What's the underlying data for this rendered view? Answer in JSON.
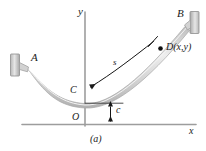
{
  "figure": {
    "caption": "(a)",
    "axes": {
      "x_label": "x",
      "y_label": "y",
      "origin_label": "O"
    },
    "points": [
      {
        "id": "A",
        "label": "A",
        "role": "left-support-attachment",
        "x": 24,
        "y": 68
      },
      {
        "id": "B",
        "label": "B",
        "role": "right-support-attachment",
        "x": 188,
        "y": 24
      },
      {
        "id": "C",
        "label": "C",
        "role": "lowest-point-on-axis",
        "x": 85,
        "y": 95
      },
      {
        "id": "D",
        "label": "D(x,y)",
        "role": "generic-point-on-cable",
        "x": 160,
        "y": 48
      }
    ],
    "dimensions": [
      {
        "id": "s",
        "label": "s",
        "role": "arc-length-from-C-to-D"
      },
      {
        "id": "c",
        "label": "c",
        "role": "sag-offset-below-lowest-point"
      }
    ],
    "supports": [
      {
        "id": "left-support",
        "side": "left"
      },
      {
        "id": "right-support",
        "side": "right"
      }
    ],
    "colors": {
      "cable_fill": "#d8d8d8",
      "cable_edge": "#a9a9a9",
      "support_fill": "#c9c9c9",
      "support_edge": "#8f8f8f",
      "axis": "#9a9a9a",
      "annotation": "#1a1a1a",
      "background": "#ffffff"
    }
  }
}
